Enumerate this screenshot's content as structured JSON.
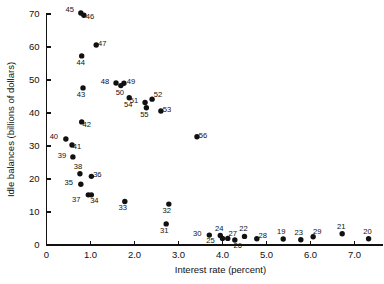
{
  "chart_data": {
    "type": "scatter",
    "title": "",
    "xlabel": "Interest rate (percent)",
    "ylabel": "Idle balances (billions of dollars)",
    "xlim": [
      0,
      7.6
    ],
    "ylim": [
      0,
      72
    ],
    "xticks": [
      0,
      1.0,
      2.0,
      3.0,
      4.0,
      5.0,
      6.0,
      7.0
    ],
    "xticklabels": [
      "0",
      "1.0",
      "2.0",
      "3.0",
      "4.0",
      "5.0",
      "6.0",
      "7.0"
    ],
    "yticks": [
      0,
      10,
      20,
      30,
      40,
      50,
      60,
      70
    ],
    "yticklabels": [
      "0",
      "10",
      "20",
      "30",
      "40",
      "50",
      "60",
      "70"
    ],
    "grid": false,
    "legend": "none",
    "marker": "filled-circle",
    "points": [
      {
        "label": "45",
        "x": 0.78,
        "y": 70.3,
        "lx": -11,
        "ly": -1
      },
      {
        "label": "46",
        "x": 0.85,
        "y": 69.6,
        "lx": 6,
        "ly": 4
      },
      {
        "label": "47",
        "x": 1.13,
        "y": 60.6,
        "lx": 6,
        "ly": 1
      },
      {
        "label": "44",
        "x": 0.8,
        "y": 57.3,
        "lx": -1,
        "ly": 9
      },
      {
        "label": "48",
        "x": 1.58,
        "y": 49.1,
        "lx": -11,
        "ly": 1
      },
      {
        "label": "49",
        "x": 1.76,
        "y": 49.0,
        "lx": 7,
        "ly": 1
      },
      {
        "label": "50",
        "x": 1.69,
        "y": 48.3,
        "lx": -1,
        "ly": 9
      },
      {
        "label": "43",
        "x": 0.83,
        "y": 47.6,
        "lx": -2,
        "ly": 9
      },
      {
        "label": "54",
        "x": 1.88,
        "y": 44.6,
        "lx": -1,
        "ly": 9
      },
      {
        "label": "52",
        "x": 2.4,
        "y": 44.2,
        "lx": 6,
        "ly": -2
      },
      {
        "label": "51",
        "x": 2.24,
        "y": 43.2,
        "lx": -11,
        "ly": 1
      },
      {
        "label": "55",
        "x": 2.27,
        "y": 41.6,
        "lx": -2,
        "ly": 9
      },
      {
        "label": "53",
        "x": 2.6,
        "y": 40.6,
        "lx": 6,
        "ly": 1
      },
      {
        "label": "42",
        "x": 0.8,
        "y": 37.3,
        "lx": 5,
        "ly": 5
      },
      {
        "label": "56",
        "x": 3.42,
        "y": 32.8,
        "lx": 6,
        "ly": 1
      },
      {
        "label": "40",
        "x": 0.44,
        "y": 32.1,
        "lx": -12,
        "ly": 0
      },
      {
        "label": "41",
        "x": 0.58,
        "y": 30.3,
        "lx": 5,
        "ly": 4
      },
      {
        "label": "39",
        "x": 0.6,
        "y": 26.7,
        "lx": -11,
        "ly": 1
      },
      {
        "label": "38",
        "x": 0.76,
        "y": 21.6,
        "lx": -2,
        "ly": -5
      },
      {
        "label": "36",
        "x": 1.02,
        "y": 20.8,
        "lx": 6,
        "ly": 1
      },
      {
        "label": "35",
        "x": 0.78,
        "y": 18.4,
        "lx": -12,
        "ly": 1
      },
      {
        "label": "37",
        "x": 0.95,
        "y": 15.2,
        "lx": -12,
        "ly": 7
      },
      {
        "label": "34",
        "x": 1.02,
        "y": 15.2,
        "lx": 3,
        "ly": 8
      },
      {
        "label": "33",
        "x": 1.78,
        "y": 13.2,
        "lx": -2,
        "ly": 9
      },
      {
        "label": "32",
        "x": 2.78,
        "y": 12.4,
        "lx": -2,
        "ly": 9
      },
      {
        "label": "31",
        "x": 2.72,
        "y": 6.4,
        "lx": -2,
        "ly": 9
      },
      {
        "label": "30",
        "x": 3.7,
        "y": 3.0,
        "lx": -12,
        "ly": 1
      },
      {
        "label": "24",
        "x": 3.95,
        "y": 2.9,
        "lx": -1,
        "ly": -4
      },
      {
        "label": "25",
        "x": 4.0,
        "y": 2.0,
        "lx": -12,
        "ly": 5
      },
      {
        "label": "27",
        "x": 4.12,
        "y": 2.0,
        "lx": 5,
        "ly": -2
      },
      {
        "label": "26",
        "x": 4.28,
        "y": 1.5,
        "lx": 3,
        "ly": 8
      },
      {
        "label": "22",
        "x": 4.5,
        "y": 2.6,
        "lx": -1,
        "ly": -5
      },
      {
        "label": "28",
        "x": 4.78,
        "y": 1.9,
        "lx": 6,
        "ly": -1
      },
      {
        "label": "19",
        "x": 5.38,
        "y": 1.8,
        "lx": -2,
        "ly": -5
      },
      {
        "label": "23",
        "x": 5.78,
        "y": 1.6,
        "lx": -2,
        "ly": -5
      },
      {
        "label": "29",
        "x": 6.06,
        "y": 2.5,
        "lx": 4,
        "ly": -3
      },
      {
        "label": "21",
        "x": 6.72,
        "y": 3.4,
        "lx": -1,
        "ly": -5
      },
      {
        "label": "20",
        "x": 7.32,
        "y": 1.9,
        "lx": -1,
        "ly": -5
      }
    ]
  }
}
